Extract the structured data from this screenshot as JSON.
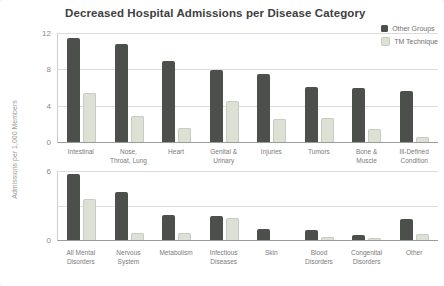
{
  "title": "Decreased Hospital Admissions per Disease Category",
  "ylabel": "Admissions per 1,000 Members",
  "legend": {
    "items": [
      {
        "label": "Other Groups",
        "color": "#4b504b"
      },
      {
        "label": "TM Technique",
        "color": "#dde1d5",
        "border": "#c6ccc0"
      }
    ]
  },
  "colors": {
    "other_groups": "#4b504b",
    "tm_technique": "#dde1d5",
    "tm_technique_border": "#c6ccc0",
    "gridline": "#dcdcdc",
    "baseline": "#9b9b9b"
  },
  "chart_data": [
    {
      "type": "bar",
      "panel": "top",
      "title": "Decreased Hospital Admissions per Disease Category",
      "ylabel": "Admissions per 1,000 Members",
      "categories": [
        "Intestinal",
        "Nose,\nThroat, Lung",
        "Heart",
        "Genital &\nUrinary",
        "Injuries",
        "Tumors",
        "Bone &\nMuscle",
        "Ill-Defined\nCondition"
      ],
      "series": [
        {
          "name": "Other Groups",
          "values": [
            11.5,
            10.8,
            8.9,
            7.9,
            7.5,
            6.1,
            6.0,
            5.6
          ]
        },
        {
          "name": "TM Technique",
          "values": [
            5.4,
            2.9,
            1.5,
            4.5,
            2.5,
            2.6,
            1.4,
            0.5
          ]
        }
      ],
      "ylim": [
        0,
        12
      ],
      "yticks": [
        0,
        4,
        8,
        12
      ],
      "gridlines": [
        4,
        8,
        12
      ],
      "legend_position": "top-right",
      "grid": true
    },
    {
      "type": "bar",
      "panel": "bottom",
      "categories": [
        "All Mental\nDisorders",
        "Nervous\nSystem",
        "Metabolism",
        "Infectious\nDiseases",
        "Skin",
        "Blood\nDisorders",
        "Congenital\nDisorders",
        "Other"
      ],
      "series": [
        {
          "name": "Other Groups",
          "values": [
            5.7,
            4.2,
            2.2,
            2.1,
            1.0,
            0.9,
            0.4,
            1.8
          ]
        },
        {
          "name": "TM Technique",
          "values": [
            3.6,
            0.6,
            0.6,
            1.9,
            0,
            0.3,
            0.15,
            0.5
          ]
        }
      ],
      "ylim": [
        0,
        6
      ],
      "yticks": [
        0,
        6
      ],
      "gridlines": [
        3,
        6
      ],
      "grid": true
    }
  ]
}
